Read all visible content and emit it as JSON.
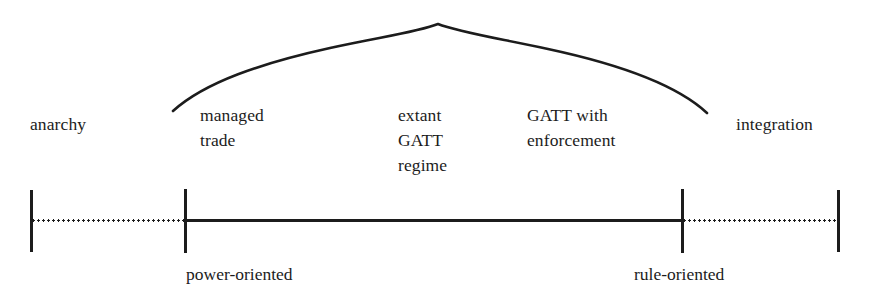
{
  "diagram": {
    "orientation": "horizontal",
    "ink_color": "#1c1c1c",
    "background_color": "#ffffff",
    "endpoints": {
      "left": "anarchy",
      "right": "integration"
    },
    "axis": {
      "y": 221,
      "ticks": [
        {
          "x": 31,
          "label": "anarchy"
        },
        {
          "x": 185,
          "label": "power-oriented"
        },
        {
          "x": 682,
          "label": "rule-oriented"
        },
        {
          "x": 838,
          "label": "integration"
        }
      ],
      "segments": [
        {
          "from": 31,
          "to": 185,
          "style": "dotted"
        },
        {
          "from": 185,
          "to": 682,
          "style": "solid"
        },
        {
          "from": 682,
          "to": 838,
          "style": "dotted"
        }
      ]
    },
    "top_labels": [
      {
        "name": "anarchy",
        "lines": "anarchy",
        "x": 30,
        "y": 112
      },
      {
        "name": "managed-trade",
        "lines": "managed\ntrade",
        "x": 200,
        "y": 103
      },
      {
        "name": "extant-gatt-regime",
        "lines": "extant\nGATT\nregime",
        "x": 398,
        "y": 103
      },
      {
        "name": "gatt-with-enforcement",
        "lines": "GATT with\nenforcement",
        "x": 527,
        "y": 103
      },
      {
        "name": "integration",
        "lines": "integration",
        "x": 736,
        "y": 112
      }
    ],
    "bottom_labels": [
      {
        "name": "power-oriented",
        "text": "power-oriented",
        "x": 186,
        "y": 262
      },
      {
        "name": "rule-oriented",
        "text": "rule-oriented",
        "x": 634,
        "y": 262
      }
    ],
    "brace": {
      "description": "curly-brace arc spanning managed trade through GATT with enforcement",
      "apex_x": 438,
      "apex_y": 24,
      "left_end_x": 173,
      "left_end_y": 111,
      "right_end_x": 707,
      "right_end_y": 113,
      "stroke_width": 2.6
    }
  }
}
